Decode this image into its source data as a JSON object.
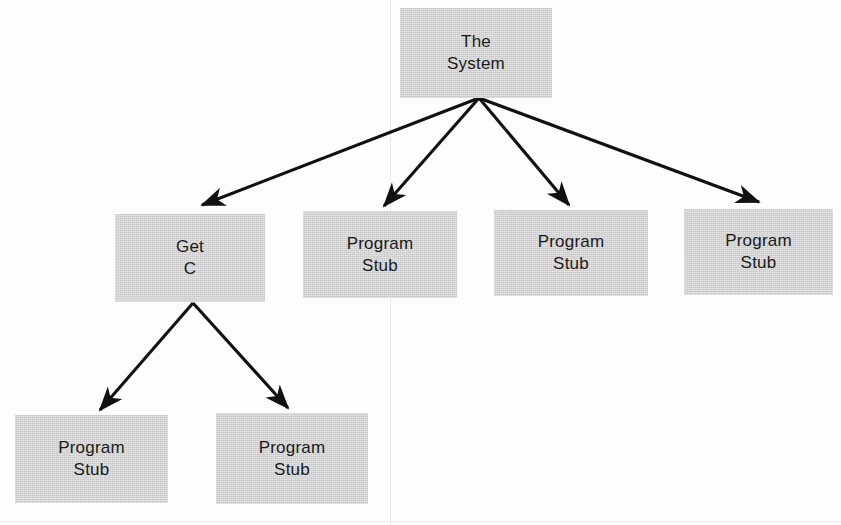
{
  "canvas": {
    "width": 841,
    "height": 525,
    "background": "#fdfdfd"
  },
  "style": {
    "node_fill": "#c9c9c9",
    "text_color": "#1a1a1a",
    "edge_color": "#111111",
    "scan_line_color": "#e9e9e9"
  },
  "diagram": {
    "type": "hierarchy-tree",
    "title_text": "",
    "nodes": [
      {
        "id": "root",
        "label_line1": "The",
        "label_line2": "System",
        "x": 400,
        "y": 8,
        "w": 152,
        "h": 90
      },
      {
        "id": "get-c",
        "label_line1": "Get",
        "label_line2": "C",
        "x": 115,
        "y": 214,
        "w": 150,
        "h": 88
      },
      {
        "id": "stub-1",
        "label_line1": "Program",
        "label_line2": "Stub",
        "x": 303,
        "y": 211,
        "w": 154,
        "h": 87
      },
      {
        "id": "stub-2",
        "label_line1": "Program",
        "label_line2": "Stub",
        "x": 494,
        "y": 210,
        "w": 154,
        "h": 86
      },
      {
        "id": "stub-3",
        "label_line1": "Program",
        "label_line2": "Stub",
        "x": 684,
        "y": 209,
        "w": 149,
        "h": 86
      },
      {
        "id": "stub-4",
        "label_line1": "Program",
        "label_line2": "Stub",
        "x": 15,
        "y": 415,
        "w": 153,
        "h": 88
      },
      {
        "id": "stub-5",
        "label_line1": "Program",
        "label_line2": "Stub",
        "x": 216,
        "y": 413,
        "w": 152,
        "h": 91
      }
    ],
    "edges": [
      {
        "from": "root",
        "to": "stub-4-left",
        "x1": 479,
        "y1": 98,
        "x2": 200,
        "y2": 206
      },
      {
        "from": "root",
        "to": "stub-1",
        "x1": 479,
        "y1": 98,
        "x2": 383,
        "y2": 207
      },
      {
        "from": "root",
        "to": "stub-2",
        "x1": 479,
        "y1": 98,
        "x2": 570,
        "y2": 206
      },
      {
        "from": "root",
        "to": "stub-3",
        "x1": 479,
        "y1": 98,
        "x2": 760,
        "y2": 203
      },
      {
        "from": "get-c",
        "to": "stub-4",
        "x1": 193,
        "y1": 303,
        "x2": 98,
        "y2": 412
      },
      {
        "from": "get-c",
        "to": "stub-5",
        "x1": 193,
        "y1": 303,
        "x2": 289,
        "y2": 410
      }
    ],
    "scan_lines": [
      {
        "orientation": "vertical",
        "x": 390
      }
    ]
  }
}
